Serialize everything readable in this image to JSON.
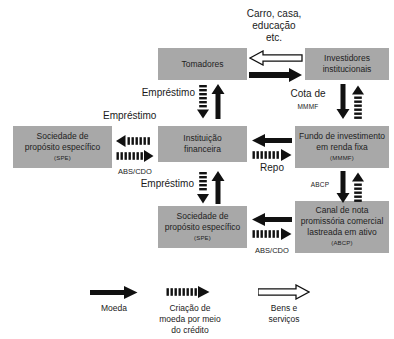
{
  "diagram": {
    "colors": {
      "box_fill": "#a8a8a8",
      "arrow_solid": "#111111",
      "arrow_striped": "#111111",
      "arrow_hollow_fill": "#ffffff",
      "arrow_hollow_stroke": "#111111",
      "text": "#1a1a1a",
      "background": "#ffffff"
    }
  },
  "nodes": {
    "tomadores": {
      "line1": "Tomadores"
    },
    "investidores": {
      "line1": "Investidores",
      "line2": "institucionais"
    },
    "spe_top": {
      "line1": "Sociedade de",
      "line2": "propósito específico",
      "abbr": "(SPE)"
    },
    "instituicao": {
      "line1": "Instituição",
      "line2": "financeira"
    },
    "fundo": {
      "line1": "Fundo de investimento",
      "line2": "em renda fixa",
      "abbr": "(MMMF)"
    },
    "spe_bottom": {
      "line1": "Sociedade de",
      "line2": "propósito específico",
      "abbr": "(SPE)"
    },
    "abcp": {
      "line1": "Canal de nota",
      "line2": "promissória comercial",
      "line3": "lastreada em ativo",
      "abbr": "(ABCP)"
    }
  },
  "edge_labels": {
    "carro_casa": {
      "line1": "Carro, casa,",
      "line2": "educação",
      "line3": "etc."
    },
    "emprestimo_tomadores": "Empréstimo",
    "emprestimo_spe_top": "Empréstimo",
    "emprestimo_spe_bottom": "Empréstimo",
    "cota_de": "Cota de",
    "cota_de_abbr": "MMMF",
    "abs_cdo_top": "ABS/CDO",
    "abs_cdo_bottom": "ABS/CDO",
    "repo": "Repo",
    "abcp_label": "ABCP"
  },
  "legend": {
    "items": [
      {
        "key": "moeda",
        "arrow": "solid",
        "line1": "Moeda",
        "line2": "",
        "line3": ""
      },
      {
        "key": "criacao-moeda",
        "arrow": "striped",
        "line1": "Criação de",
        "line2": "moeda por meio",
        "line3": "do crédito"
      },
      {
        "key": "bens-servicos",
        "arrow": "hollow",
        "line1": "Bens e",
        "line2": "serviços",
        "line3": ""
      }
    ]
  }
}
